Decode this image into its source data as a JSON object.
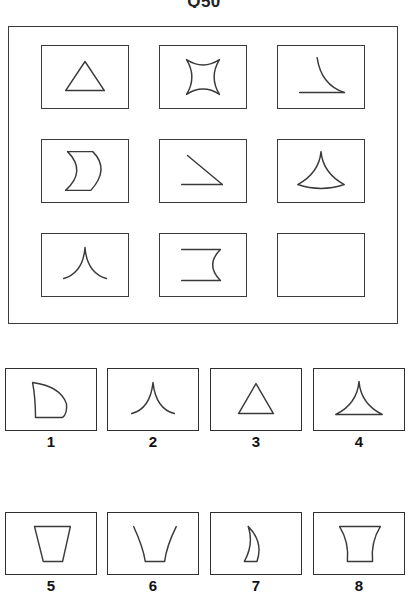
{
  "page": {
    "title": "Q50",
    "type": "visual-analogy-matrix-puzzle"
  },
  "matrix": {
    "name": "3x3-figure-matrix",
    "rows": 3,
    "cols": 3,
    "cells": [
      {
        "index": 1,
        "row": 1,
        "col": 1,
        "figure": "triangle",
        "description": "straight-sided triangle"
      },
      {
        "index": 2,
        "row": 1,
        "col": 2,
        "figure": "four-pointed-concave-star",
        "description": "square with four concave sides forming a star"
      },
      {
        "index": 3,
        "row": 1,
        "col": 3,
        "figure": "concave-curve-with-baseline",
        "description": "concave curve meeting a horizontal base line"
      },
      {
        "index": 4,
        "row": 2,
        "col": 1,
        "figure": "crescent-bean",
        "description": "D-shape with concave left side"
      },
      {
        "index": 5,
        "row": 2,
        "col": 2,
        "figure": "angle-straight-lines",
        "description": "diagonal line meeting a horizontal base line"
      },
      {
        "index": 6,
        "row": 2,
        "col": 3,
        "figure": "spire-with-curved-base",
        "description": "tall concave-sided spire on a curved base"
      },
      {
        "index": 7,
        "row": 3,
        "col": 1,
        "figure": "concave-peak",
        "description": "caret peak with concave curved sides, no base"
      },
      {
        "index": 8,
        "row": 3,
        "col": 2,
        "figure": "bracket-concave-right",
        "description": "two horizontal lines joined by a concave curve on the right"
      },
      {
        "index": 9,
        "row": 3,
        "col": 3,
        "figure": "empty",
        "description": "blank answer cell"
      }
    ]
  },
  "options": {
    "name": "answer-options",
    "count": 8,
    "items": [
      {
        "number": "1",
        "figure": "claw-fin",
        "description": "curved claw / fin shape with flat bottom"
      },
      {
        "number": "2",
        "figure": "concave-peak",
        "description": "caret peak with concave curved sides"
      },
      {
        "number": "3",
        "figure": "triangle",
        "description": "straight-sided triangle"
      },
      {
        "number": "4",
        "figure": "concave-triangle",
        "description": "triangle with concave sides, flat base"
      },
      {
        "number": "5",
        "figure": "trapezoid",
        "description": "trapezoid narrow at the bottom"
      },
      {
        "number": "6",
        "figure": "open-cup",
        "description": "open cup with concave flaring sides"
      },
      {
        "number": "7",
        "figure": "thin-crescent",
        "description": "narrow crescent moon"
      },
      {
        "number": "8",
        "figure": "goblet-vase",
        "description": "vase / goblet with concave sides"
      }
    ]
  },
  "colors": {
    "stroke": "#3a3a3a",
    "border": "#3b3b3b",
    "background": "#ffffff",
    "label": "#111111"
  }
}
